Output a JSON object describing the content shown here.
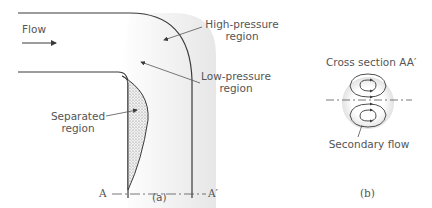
{
  "figure_a": {
    "caption": "(a)",
    "flow_label": "Flow",
    "high_pressure": {
      "line1": "High-pressure",
      "line2": "region"
    },
    "low_pressure": {
      "line1": "Low-pressure",
      "line2": "region"
    },
    "separated": {
      "line1": "Separated",
      "line2": "region"
    },
    "section_start": "A",
    "section_end": "A′"
  },
  "figure_b": {
    "caption": "(b)",
    "title": "Cross section AA′",
    "secondary_flow": "Secondary flow"
  },
  "colors": {
    "line": "#3a3a3a",
    "shading": "#e8e8e8",
    "separated_fill": "#d6d6d6",
    "text": "#555555"
  }
}
